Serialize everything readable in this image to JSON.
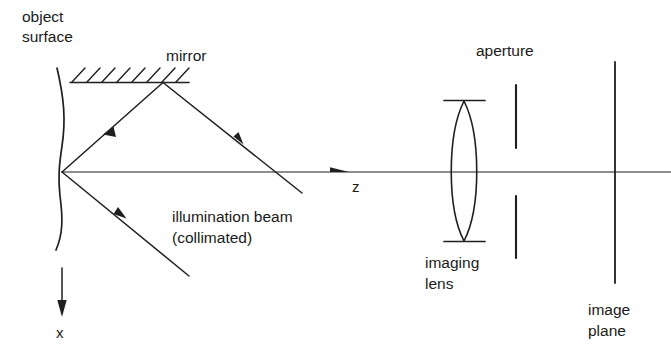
{
  "figure": {
    "title_alt": "Optical layout: collimated illumination beam, mirror, object surface, imaging lens, aperture, image plane",
    "background_color": "#ffffff",
    "ink_color": "#1f1f1f",
    "width": 671,
    "height": 361
  },
  "labels": {
    "object_surface_line1": "object",
    "object_surface_line2": "surface",
    "mirror": "mirror",
    "illumination_line1": "illumination  beam",
    "illumination_line2": "(collimated)",
    "axis_z": "z",
    "axis_x": "x",
    "aperture": "aperture",
    "imaging_lens_line1": "imaging",
    "imaging_lens_line2": "lens",
    "image_plane_line1": "image",
    "image_plane_line2": "plane"
  },
  "components": {
    "object_surface": {
      "name": "object-surface",
      "shape": "wavy-vertical-curve",
      "x_center": 60,
      "y_top": 68,
      "y_bottom": 250
    },
    "mirror": {
      "name": "mirror",
      "x_start": 70,
      "x_end": 189,
      "y": 82,
      "hatch_count": 8,
      "hatch_direction": "up-right"
    },
    "imaging_lens": {
      "name": "imaging-lens",
      "shape": "biconvex",
      "x_center": 464,
      "y_top": 100,
      "y_bottom": 242,
      "half_width": 13
    },
    "aperture": {
      "name": "aperture",
      "x": 516,
      "upper_bar_y_top": 85,
      "upper_bar_y_bottom": 148,
      "lower_bar_y_top": 196,
      "lower_bar_y_bottom": 258
    },
    "image_plane": {
      "name": "image-plane",
      "x": 615,
      "y_top": 62,
      "y_bottom": 283
    },
    "optical_axis": {
      "name": "optical-axis",
      "y": 172,
      "x_start": 62,
      "x_end": 671,
      "arrow_x": 345
    },
    "x_axis": {
      "name": "x-axis-arrow",
      "x": 62,
      "y_start": 268,
      "y_end": 316
    }
  },
  "rays": [
    {
      "name": "incoming-collimated-ray",
      "from": [
        302,
        193
      ],
      "to": [
        163,
        82
      ],
      "arrow_at": [
        238,
        140
      ],
      "arrow_direction": "up-left"
    },
    {
      "name": "mirror-to-object-ray",
      "from": [
        163,
        82
      ],
      "to": [
        62,
        172
      ],
      "arrow_at": [
        108,
        131
      ],
      "arrow_direction": "down-left"
    },
    {
      "name": "object-to-lower-right-ray",
      "from": [
        62,
        172
      ],
      "to": [
        189,
        276
      ],
      "arrow_at": [
        120,
        220
      ],
      "arrow_direction": "up-left"
    }
  ]
}
